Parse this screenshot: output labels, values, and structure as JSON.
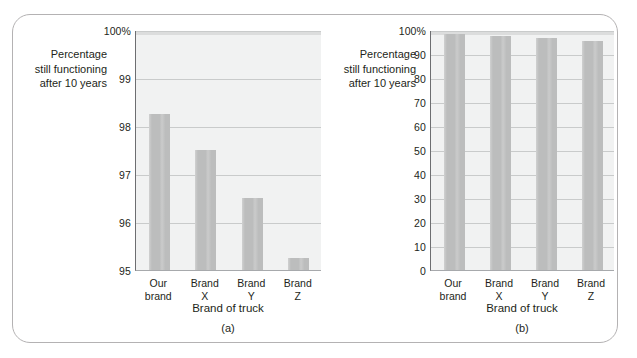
{
  "figure": {
    "panel_a_caption": "(a)",
    "panel_b_caption": "(b)",
    "axis_label_y": "Percentage\nstill functioning\nafter 10 years",
    "axis_label_x": "Brand of truck",
    "bar_color": "#bcbdbd",
    "plot_background": "#f1f2f2",
    "gridline_color": "#c9cbcb",
    "frame_color": "#b4b2b3"
  },
  "chart_data": [
    {
      "type": "bar",
      "title": "(a)",
      "categories": [
        "Our\nbrand",
        "Brand\nX",
        "Brand\nY",
        "Brand\nZ"
      ],
      "category_labels_flat": [
        "Our brand",
        "Brand X",
        "Brand Y",
        "Brand Z"
      ],
      "values": [
        98.25,
        97.5,
        96.5,
        95.25
      ],
      "xlabel": "Brand of truck",
      "ylabel": "Percentage still functioning after 10 years",
      "ylim": [
        95,
        100
      ],
      "yticks": [
        95,
        96,
        97,
        98,
        99,
        100
      ],
      "ytick_labels": [
        "95",
        "96",
        "97",
        "98",
        "99",
        "100%"
      ],
      "grid": true,
      "legend": "none",
      "note": "truncated y-axis beginning at 95 exaggerates differences"
    },
    {
      "type": "bar",
      "title": "(b)",
      "categories": [
        "Our\nbrand",
        "Brand\nX",
        "Brand\nY",
        "Brand\nZ"
      ],
      "category_labels_flat": [
        "Our brand",
        "Brand X",
        "Brand Y",
        "Brand Z"
      ],
      "values": [
        98.25,
        97.5,
        96.5,
        95.25
      ],
      "xlabel": "Brand of truck",
      "ylabel": "Percentage still functioning after 10 years",
      "ylim": [
        0,
        100
      ],
      "yticks": [
        0,
        10,
        20,
        30,
        40,
        50,
        60,
        70,
        80,
        90,
        100
      ],
      "ytick_labels": [
        "0",
        "10",
        "20",
        "30",
        "40",
        "50",
        "60",
        "70",
        "80",
        "90",
        "100%"
      ],
      "grid": true,
      "legend": "none",
      "note": "full y-axis from zero shows the brands are nearly identical"
    }
  ]
}
